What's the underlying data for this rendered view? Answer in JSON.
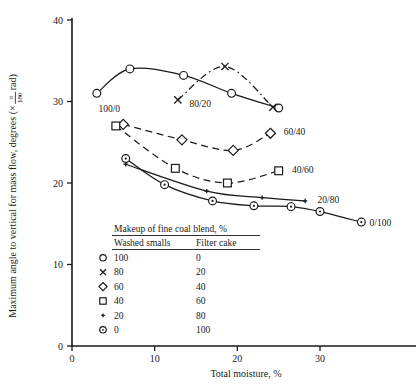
{
  "chart_data": {
    "type": "line",
    "title": "",
    "xlabel": "Total moisture, %",
    "ylabel": "Maximum angle to vertical for mass flow, degrees (× π/180 rad)",
    "ylabel_prefix": "Maximum angle to vertical for mass flow, degrees (×",
    "ylabel_num": "π",
    "ylabel_den": "180",
    "ylabel_suffix": "rad)",
    "xlim": [
      0,
      38
    ],
    "ylim": [
      0,
      42
    ],
    "xticks": [
      "0",
      "10",
      "20",
      "30"
    ],
    "xtick_values": [
      0,
      10,
      20,
      30
    ],
    "yticks": [
      "0",
      "10",
      "20",
      "30",
      "40"
    ],
    "ytick_values": [
      0,
      10,
      20,
      30,
      40
    ],
    "grid": false,
    "legend_position": "inside-lower-left",
    "series": [
      {
        "name": "100/0",
        "label": "100/0",
        "marker": "circle",
        "linestyle": "solid",
        "x": [
          3.0,
          7.0,
          13.5,
          19.3,
          25.0
        ],
        "y": [
          31.0,
          34.0,
          33.2,
          31.0,
          29.2
        ],
        "label_x": 3.2,
        "label_y": 29.2
      },
      {
        "name": "80/20",
        "label": "80/20",
        "marker": "x",
        "linestyle": "dashdot",
        "x": [
          12.8,
          18.5,
          24.3
        ],
        "y": [
          30.2,
          34.3,
          29.3
        ],
        "label_x": 14.2,
        "label_y": 29.7
      },
      {
        "name": "60/40",
        "label": "60/40",
        "marker": "diamond",
        "linestyle": "dashed",
        "x": [
          6.2,
          13.3,
          19.5,
          24.0
        ],
        "y": [
          27.2,
          25.3,
          24.0,
          26.1
        ],
        "label_x": 25.6,
        "label_y": 26.3
      },
      {
        "name": "40/60",
        "label": "40/60",
        "marker": "square",
        "linestyle": "dashed",
        "x": [
          5.3,
          12.5,
          18.8,
          25.0
        ],
        "y": [
          27.0,
          21.8,
          20.0,
          21.5
        ],
        "label_x": 26.6,
        "label_y": 21.6
      },
      {
        "name": "20/80",
        "label": "20/80",
        "marker": "plus",
        "linestyle": "solid",
        "x": [
          6.5,
          16.3,
          23.0,
          28.2
        ],
        "y": [
          22.3,
          19.0,
          18.2,
          17.8
        ],
        "label_x": 29.7,
        "label_y": 18.0
      },
      {
        "name": "0/100",
        "label": "0/100",
        "marker": "circle-dot",
        "linestyle": "solid",
        "x": [
          6.5,
          11.2,
          17.0,
          22.0,
          26.5,
          30.0,
          35.0
        ],
        "y": [
          23.0,
          19.8,
          17.8,
          17.2,
          17.1,
          16.5,
          15.2
        ],
        "label_x": 36.0,
        "label_y": 15.2
      }
    ],
    "legend": {
      "title": "Makeup of fine coal blend, %",
      "columns": [
        "Washed smalls",
        "Filter cake"
      ],
      "rows": [
        {
          "marker": "circle",
          "washed_smalls": "100",
          "filter_cake": "0"
        },
        {
          "marker": "x",
          "washed_smalls": "80",
          "filter_cake": "20"
        },
        {
          "marker": "diamond",
          "washed_smalls": "60",
          "filter_cake": "40"
        },
        {
          "marker": "square",
          "washed_smalls": "40",
          "filter_cake": "60"
        },
        {
          "marker": "plus",
          "washed_smalls": "20",
          "filter_cake": "80"
        },
        {
          "marker": "circle-dot",
          "washed_smalls": "0",
          "filter_cake": "100"
        }
      ]
    },
    "colors": {
      "ink": "#1a1a1a",
      "background": "#ffffff"
    }
  }
}
